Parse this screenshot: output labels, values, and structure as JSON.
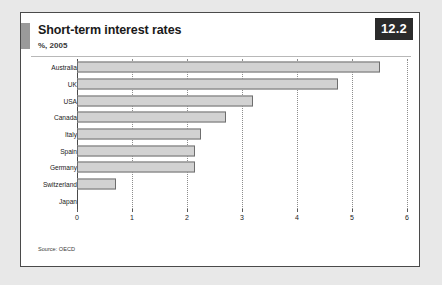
{
  "figure": {
    "badge": "12.2",
    "title": "Short-term interest rates",
    "subtitle": "%, 2005",
    "source": "Source: OECD"
  },
  "chart_data": {
    "type": "bar",
    "orientation": "horizontal",
    "title": "Short-term interest rates",
    "subtitle": "%, 2005",
    "xlabel": "",
    "ylabel": "",
    "xlim": [
      0,
      6
    ],
    "xticks": [
      0,
      1,
      2,
      3,
      4,
      5,
      6
    ],
    "xtick_labels": [
      "0",
      "1",
      "2",
      "3",
      "4",
      "5",
      "6"
    ],
    "grid": "vertical-dotted",
    "legend": "none",
    "categories": [
      "Australia",
      "UK",
      "USA",
      "Canada",
      "Italy",
      "Spain",
      "Germany",
      "Switzerland",
      "Japan"
    ],
    "values": [
      5.5,
      4.75,
      3.2,
      2.7,
      2.25,
      2.15,
      2.15,
      0.7,
      0
    ],
    "bar_color": "#d2d2d2",
    "bar_edge_color": "#6e6e6e",
    "source": "Source: OECD"
  },
  "colors": {
    "page_background": "#e8e8e8",
    "card_background": "#ffffff",
    "card_border": "#4a4a4a",
    "badge_background": "#2b2b2b",
    "badge_text": "#ffffff",
    "accent_tab": "#9a9a9a",
    "gridline": "#8d8d8d"
  }
}
